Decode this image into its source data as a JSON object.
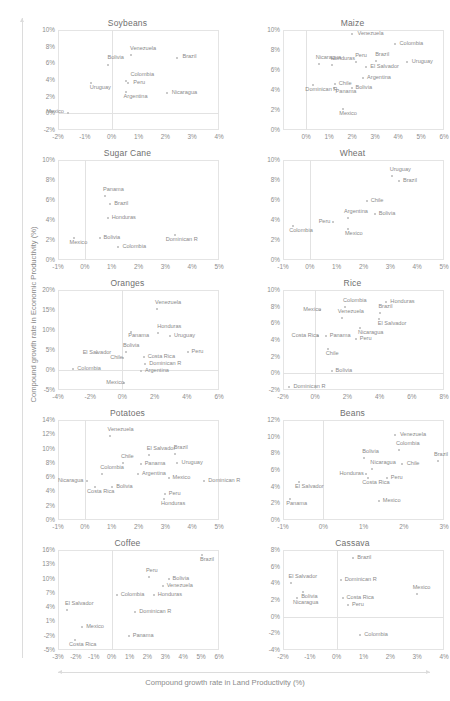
{
  "figure": {
    "xlabel": "Compound growth rate in Land Productivity (%)",
    "ylabel": "Compound growth rate in Economic Productivity (%)",
    "marker_color": "#b9b9b9",
    "grid_color": "#e4e4e4",
    "text_color": "#8a8a8a"
  },
  "chart_data": [
    {
      "type": "scatter",
      "title": "Soybeans",
      "xlabel": "Compound growth rate in Land Productivity (%)",
      "ylabel": "Compound growth rate in Economic Productivity (%)",
      "xlim": [
        -2,
        4
      ],
      "ylim": [
        -2,
        10
      ],
      "xticks": [
        "-2%",
        "-1%",
        "0%",
        "1%",
        "2%",
        "3%",
        "4%"
      ],
      "yticks": [
        "10%",
        "8%",
        "6%",
        "4%",
        "2%",
        "0%",
        "-2%"
      ],
      "grid": true,
      "legend": "none",
      "points": [
        {
          "label": "Venezuela",
          "x": 0.72,
          "y": 7.0,
          "lx": -1,
          "ly": -7
        },
        {
          "label": "Brazil",
          "x": 2.45,
          "y": 6.7,
          "lx": 5,
          "ly": -2
        },
        {
          "label": "Bolivia",
          "x": -0.12,
          "y": 5.8,
          "lx": -1,
          "ly": -8
        },
        {
          "label": "Colombia",
          "x": 0.55,
          "y": 3.9,
          "lx": 0,
          "ly": -7
        },
        {
          "label": "Peru",
          "x": 0.62,
          "y": 3.6,
          "lx": 5,
          "ly": -1
        },
        {
          "label": "Uruguay",
          "x": -0.78,
          "y": 3.6,
          "lx": -1,
          "ly": 4
        },
        {
          "label": "Argentina",
          "x": 0.52,
          "y": 2.6,
          "lx": -2,
          "ly": 4
        },
        {
          "label": "Nicaragua",
          "x": 2.05,
          "y": 2.4,
          "lx": 5,
          "ly": -1
        },
        {
          "label": "Mexico",
          "x": -1.62,
          "y": 0.0,
          "lx": -22,
          "ly": -2
        }
      ]
    },
    {
      "type": "scatter",
      "title": "Maize",
      "xlim": [
        -1,
        6
      ],
      "ylim": [
        0,
        10
      ],
      "xticks": [
        "0%",
        "1%",
        "2%",
        "3%",
        "4%",
        "5%",
        "6%"
      ],
      "yticks": [
        "10%",
        "8%",
        "6%",
        "4%",
        "2%",
        "0%"
      ],
      "grid": true,
      "points": [
        {
          "label": "Venezuela",
          "x": 2.02,
          "y": 9.6,
          "lx": 5,
          "ly": -1
        },
        {
          "label": "Colombia",
          "x": 3.85,
          "y": 8.6,
          "lx": 5,
          "ly": -1
        },
        {
          "label": "Nicaragua",
          "x": 0.55,
          "y": 6.6,
          "lx": -3,
          "ly": -7
        },
        {
          "label": "Honduras",
          "x": 1.12,
          "y": 6.5,
          "lx": -1,
          "ly": -7
        },
        {
          "label": "Peru",
          "x": 2.18,
          "y": 6.8,
          "lx": -1,
          "ly": -7
        },
        {
          "label": "Brazil",
          "x": 3.05,
          "y": 6.9,
          "lx": -1,
          "ly": -7
        },
        {
          "label": "Uruguay",
          "x": 4.38,
          "y": 6.8,
          "lx": 5,
          "ly": -1
        },
        {
          "label": "El Salvador",
          "x": 2.62,
          "y": 6.3,
          "lx": 4,
          "ly": -1
        },
        {
          "label": "Argentina",
          "x": 2.48,
          "y": 5.2,
          "lx": 4,
          "ly": -1
        },
        {
          "label": "Chile",
          "x": 1.25,
          "y": 4.6,
          "lx": 4,
          "ly": -1
        },
        {
          "label": "Panama",
          "x": 1.2,
          "y": 4.2,
          "lx": 2,
          "ly": 3
        },
        {
          "label": "Bolivia",
          "x": 1.98,
          "y": 4.2,
          "lx": 4,
          "ly": -1
        },
        {
          "label": "Dominican R",
          "x": 0.32,
          "y": 4.5,
          "lx": -8,
          "ly": 4
        },
        {
          "label": "Mexico",
          "x": 1.62,
          "y": 2.1,
          "lx": -4,
          "ly": 4
        }
      ]
    },
    {
      "type": "scatter",
      "title": "Sugar Cane",
      "xlim": [
        -1,
        5
      ],
      "ylim": [
        0,
        10
      ],
      "xticks": [
        "-1%",
        "0%",
        "1%",
        "2%",
        "3%",
        "4%",
        "5%"
      ],
      "yticks": [
        "10%",
        "8%",
        "6%",
        "4%",
        "2%",
        "0%"
      ],
      "grid": true,
      "points": [
        {
          "label": "Panama",
          "x": 0.75,
          "y": 6.4,
          "lx": -2,
          "ly": -7
        },
        {
          "label": "Brazil",
          "x": 0.95,
          "y": 5.6,
          "lx": 4,
          "ly": -1
        },
        {
          "label": "Honduras",
          "x": 0.85,
          "y": 4.2,
          "lx": 4,
          "ly": -1
        },
        {
          "label": "Dominican R",
          "x": 3.35,
          "y": 2.5,
          "lx": -9,
          "ly": 4
        },
        {
          "label": "Bolivia",
          "x": 0.55,
          "y": 2.2,
          "lx": 4,
          "ly": -1
        },
        {
          "label": "Mexico",
          "x": -0.42,
          "y": 2.2,
          "lx": -4,
          "ly": 4
        },
        {
          "label": "Colombia",
          "x": 1.25,
          "y": 1.3,
          "lx": 4,
          "ly": -1
        }
      ]
    },
    {
      "type": "scatter",
      "title": "Wheat",
      "xlim": [
        -1,
        5
      ],
      "ylim": [
        0,
        10
      ],
      "xticks": [
        "-1%",
        "0%",
        "1%",
        "2%",
        "3%",
        "4%",
        "5%"
      ],
      "yticks": [
        "10%",
        "8%",
        "6%",
        "4%",
        "2%",
        "0%"
      ],
      "grid": true,
      "points": [
        {
          "label": "Uruguay",
          "x": 3.05,
          "y": 8.4,
          "lx": -2,
          "ly": -7
        },
        {
          "label": "Brazil",
          "x": 3.32,
          "y": 7.9,
          "lx": 4,
          "ly": -1
        },
        {
          "label": "Chile",
          "x": 2.12,
          "y": 5.9,
          "lx": 4,
          "ly": -1
        },
        {
          "label": "Bolivia",
          "x": 2.42,
          "y": 4.6,
          "lx": 4,
          "ly": -1
        },
        {
          "label": "Argentina",
          "x": 1.42,
          "y": 4.2,
          "lx": -4,
          "ly": -7
        },
        {
          "label": "Peru",
          "x": 0.85,
          "y": 3.8,
          "lx": -14,
          "ly": -1
        },
        {
          "label": "Colombia",
          "x": -0.62,
          "y": 3.4,
          "lx": -4,
          "ly": 4
        },
        {
          "label": "Mexico",
          "x": 1.42,
          "y": 3.1,
          "lx": -3,
          "ly": 4
        }
      ]
    },
    {
      "type": "scatter",
      "title": "Oranges",
      "xlim": [
        -4,
        6
      ],
      "ylim": [
        -5,
        20
      ],
      "xticks": [
        "-4%",
        "-2%",
        "0%",
        "2%",
        "4%",
        "6%"
      ],
      "yticks": [
        "20%",
        "15%",
        "10%",
        "5%",
        "0%",
        "-5%"
      ],
      "grid": true,
      "points": [
        {
          "label": "Venezuela",
          "x": 2.15,
          "y": 15.3,
          "lx": -2,
          "ly": -7
        },
        {
          "label": "Honduras",
          "x": 2.22,
          "y": 9.3,
          "lx": -1,
          "ly": -7
        },
        {
          "label": "Panama",
          "x": 0.55,
          "y": 9.5,
          "lx": -3,
          "ly": 3
        },
        {
          "label": "Uruguay",
          "x": 2.95,
          "y": 8.4,
          "lx": 4,
          "ly": -1
        },
        {
          "label": "Peru",
          "x": 4.05,
          "y": 4.6,
          "lx": 4,
          "ly": -1
        },
        {
          "label": "Bolivia",
          "x": 0.22,
          "y": 4.6,
          "lx": -3,
          "ly": -7
        },
        {
          "label": "El Salvador",
          "x": -1.6,
          "y": 4.2,
          "lx": -14,
          "ly": -1
        },
        {
          "label": "Costa Rica",
          "x": 1.32,
          "y": 3.3,
          "lx": 4,
          "ly": -1
        },
        {
          "label": "Chile",
          "x": 0.05,
          "y": 3.1,
          "lx": -13,
          "ly": -1
        },
        {
          "label": "Dominican R",
          "x": 1.42,
          "y": 1.6,
          "lx": 4,
          "ly": -1
        },
        {
          "label": "Argentina",
          "x": 1.15,
          "y": -0.2,
          "lx": 4,
          "ly": -1
        },
        {
          "label": "Colombia",
          "x": -3.05,
          "y": 0.2,
          "lx": 4,
          "ly": -1
        },
        {
          "label": "Mexico",
          "x": 0.12,
          "y": -3.3,
          "lx": -18,
          "ly": -1
        }
      ]
    },
    {
      "type": "scatter",
      "title": "Rice",
      "xlim": [
        -2,
        8
      ],
      "ylim": [
        -2,
        10
      ],
      "xticks": [
        "-2%",
        "0%",
        "2%",
        "4%",
        "6%",
        "8%"
      ],
      "yticks": [
        "10%",
        "8%",
        "6%",
        "4%",
        "2%",
        "0%",
        "-2%"
      ],
      "grid": true,
      "points": [
        {
          "label": "Honduras",
          "x": 4.42,
          "y": 8.6,
          "lx": 4,
          "ly": -1
        },
        {
          "label": "Colombia",
          "x": 1.85,
          "y": 8.0,
          "lx": -2,
          "ly": -7
        },
        {
          "label": "Mexico",
          "x": 0.32,
          "y": 7.6,
          "lx": -17,
          "ly": -1
        },
        {
          "label": "Brazil",
          "x": 4.05,
          "y": 7.2,
          "lx": -2,
          "ly": -7
        },
        {
          "label": "Venezuela",
          "x": 1.65,
          "y": 6.6,
          "lx": -4,
          "ly": -7
        },
        {
          "label": "El Salvador",
          "x": 3.95,
          "y": 6.5,
          "lx": -1,
          "ly": 4
        },
        {
          "label": "Nicaragua",
          "x": 2.78,
          "y": 5.4,
          "lx": -2,
          "ly": 4
        },
        {
          "label": "Panama",
          "x": 0.65,
          "y": 4.5,
          "lx": 4,
          "ly": -1
        },
        {
          "label": "Costa Rica",
          "x": 0.15,
          "y": 4.5,
          "lx": -26,
          "ly": -1
        },
        {
          "label": "Peru",
          "x": 2.52,
          "y": 4.1,
          "lx": 4,
          "ly": -1
        },
        {
          "label": "Chile",
          "x": 0.78,
          "y": 2.9,
          "lx": -2,
          "ly": 4
        },
        {
          "label": "Bolivia",
          "x": 1.02,
          "y": 0.3,
          "lx": 4,
          "ly": -1
        },
        {
          "label": "Dominican R",
          "x": -1.6,
          "y": -1.6,
          "lx": 4,
          "ly": -1
        }
      ]
    },
    {
      "type": "scatter",
      "title": "Potatoes",
      "xlim": [
        -1,
        5
      ],
      "ylim": [
        0,
        14
      ],
      "xticks": [
        "-1%",
        "0%",
        "1%",
        "2%",
        "3%",
        "4%",
        "5%"
      ],
      "yticks": [
        "14%",
        "12%",
        "10%",
        "8%",
        "6%",
        "4%",
        "2%",
        "0%"
      ],
      "grid": true,
      "points": [
        {
          "label": "Venezuela",
          "x": 0.92,
          "y": 11.7,
          "lx": -2,
          "ly": -7
        },
        {
          "label": "El Salvador",
          "x": 2.38,
          "y": 9.1,
          "lx": -2,
          "ly": -7
        },
        {
          "label": "Brazil",
          "x": 3.35,
          "y": 9.2,
          "lx": -1,
          "ly": -7
        },
        {
          "label": "Uruguay",
          "x": 3.42,
          "y": 8.0,
          "lx": 5,
          "ly": -1
        },
        {
          "label": "Chile",
          "x": 1.42,
          "y": 8.0,
          "lx": -2,
          "ly": -7
        },
        {
          "label": "Panama",
          "x": 2.08,
          "y": 7.9,
          "lx": 4,
          "ly": -1
        },
        {
          "label": "Colombia",
          "x": 0.65,
          "y": 6.5,
          "lx": -2,
          "ly": -7
        },
        {
          "label": "Argentina",
          "x": 1.98,
          "y": 6.4,
          "lx": 4,
          "ly": -1
        },
        {
          "label": "Mexico",
          "x": 3.12,
          "y": 5.9,
          "lx": 4,
          "ly": -1
        },
        {
          "label": "Nicaragua",
          "x": 0.08,
          "y": 5.5,
          "lx": -29,
          "ly": -1
        },
        {
          "label": "Dominican R",
          "x": 4.45,
          "y": 5.4,
          "lx": 4,
          "ly": -1
        },
        {
          "label": "Bolivia",
          "x": 1.02,
          "y": 4.6,
          "lx": 4,
          "ly": -1
        },
        {
          "label": "Costa Rica",
          "x": 0.38,
          "y": 4.6,
          "lx": -8,
          "ly": 4
        },
        {
          "label": "Peru",
          "x": 2.98,
          "y": 3.6,
          "lx": 4,
          "ly": -1
        },
        {
          "label": "Honduras",
          "x": 2.95,
          "y": 3.0,
          "lx": -3,
          "ly": 4
        }
      ]
    },
    {
      "type": "scatter",
      "title": "Beans",
      "xlim": [
        -1,
        3
      ],
      "ylim": [
        0,
        12
      ],
      "xticks": [
        "-1%",
        "0%",
        "1%",
        "2%",
        "3%"
      ],
      "yticks": [
        "12%",
        "10%",
        "8%",
        "6%",
        "4%",
        "2%",
        "0%"
      ],
      "grid": true,
      "points": [
        {
          "label": "Venezuela",
          "x": 1.78,
          "y": 10.2,
          "lx": 5,
          "ly": -1
        },
        {
          "label": "Colombia",
          "x": 1.88,
          "y": 8.4,
          "lx": -3,
          "ly": -7
        },
        {
          "label": "Bolivia",
          "x": 1.02,
          "y": 7.5,
          "lx": -2,
          "ly": -7
        },
        {
          "label": "Chile",
          "x": 1.95,
          "y": 6.7,
          "lx": 5,
          "ly": -1
        },
        {
          "label": "Brazil",
          "x": 2.85,
          "y": 7.1,
          "lx": -4,
          "ly": -7
        },
        {
          "label": "Nicaragua",
          "x": 1.22,
          "y": 6.1,
          "lx": -2,
          "ly": -7
        },
        {
          "label": "Honduras",
          "x": 1.05,
          "y": 5.5,
          "lx": -26,
          "ly": -1
        },
        {
          "label": "Peru",
          "x": 1.58,
          "y": 5.0,
          "lx": 4,
          "ly": -1
        },
        {
          "label": "Costa Rica",
          "x": 1.12,
          "y": 5.1,
          "lx": -6,
          "ly": 4
        },
        {
          "label": "El Salvador",
          "x": -0.6,
          "y": 4.6,
          "lx": -4,
          "ly": 4
        },
        {
          "label": "Mexico",
          "x": 1.38,
          "y": 2.3,
          "lx": 4,
          "ly": -1
        },
        {
          "label": "Panama",
          "x": -0.82,
          "y": 2.5,
          "lx": -4,
          "ly": 4
        }
      ]
    },
    {
      "type": "scatter",
      "title": "Coffee",
      "xlim": [
        -3,
        6
      ],
      "ylim": [
        -5,
        16
      ],
      "xticks": [
        "-3%",
        "-2%",
        "-1%",
        "0%",
        "1%",
        "2%",
        "3%",
        "4%",
        "5%",
        "6%"
      ],
      "yticks": [
        "16%",
        "13%",
        "10%",
        "7%",
        "4%",
        "1%",
        "-2%",
        "-5%"
      ],
      "grid": true,
      "points": [
        {
          "label": "Brazil",
          "x": 5.05,
          "y": 15.0,
          "lx": -2,
          "ly": 4
        },
        {
          "label": "Peru",
          "x": 2.08,
          "y": 10.3,
          "lx": -3,
          "ly": -7
        },
        {
          "label": "Bolivia",
          "x": 3.18,
          "y": 10.0,
          "lx": 4,
          "ly": -1
        },
        {
          "label": "Venezuela",
          "x": 2.85,
          "y": 8.5,
          "lx": 4,
          "ly": -1
        },
        {
          "label": "Honduras",
          "x": 2.35,
          "y": 6.6,
          "lx": 4,
          "ly": -1
        },
        {
          "label": "Colombia",
          "x": 0.28,
          "y": 6.5,
          "lx": 4,
          "ly": -1
        },
        {
          "label": "Dominican R",
          "x": 1.32,
          "y": 2.9,
          "lx": 4,
          "ly": -1
        },
        {
          "label": "El Salvador",
          "x": -2.5,
          "y": 3.5,
          "lx": -2,
          "ly": -7
        },
        {
          "label": "Mexico",
          "x": -1.65,
          "y": -0.2,
          "lx": 4,
          "ly": -1
        },
        {
          "label": "Panama",
          "x": 0.95,
          "y": -2.1,
          "lx": 4,
          "ly": -1
        },
        {
          "label": "Costa Rica",
          "x": -2.05,
          "y": -3.0,
          "lx": -6,
          "ly": 4
        }
      ]
    },
    {
      "type": "scatter",
      "title": "Cassava",
      "xlim": [
        -2,
        4
      ],
      "ylim": [
        -4,
        8
      ],
      "xticks": [
        "-2%",
        "-1%",
        "0%",
        "1%",
        "2%",
        "3%",
        "4%"
      ],
      "yticks": [
        "8%",
        "6%",
        "4%",
        "2%",
        "0%",
        "-2%",
        "-4%"
      ],
      "grid": true,
      "points": [
        {
          "label": "Brazil",
          "x": 0.62,
          "y": 7.1,
          "lx": 4,
          "ly": -1
        },
        {
          "label": "Dominican R",
          "x": 0.15,
          "y": 4.4,
          "lx": 4,
          "ly": -1
        },
        {
          "label": "El Salvador",
          "x": -1.72,
          "y": 4.0,
          "lx": -2,
          "ly": -7
        },
        {
          "label": "Bolivia",
          "x": -1.25,
          "y": 3.0,
          "lx": -2,
          "ly": 4
        },
        {
          "label": "Mexico",
          "x": 2.98,
          "y": 2.7,
          "lx": -4,
          "ly": -7
        },
        {
          "label": "Costa Rica",
          "x": 0.22,
          "y": 2.2,
          "lx": 4,
          "ly": -1
        },
        {
          "label": "Nicaragua",
          "x": -1.48,
          "y": 2.2,
          "lx": -4,
          "ly": 4
        },
        {
          "label": "Peru",
          "x": 0.42,
          "y": 1.4,
          "lx": 4,
          "ly": -1
        },
        {
          "label": "Colombia",
          "x": 0.88,
          "y": -2.2,
          "lx": 4,
          "ly": -1
        }
      ]
    }
  ]
}
